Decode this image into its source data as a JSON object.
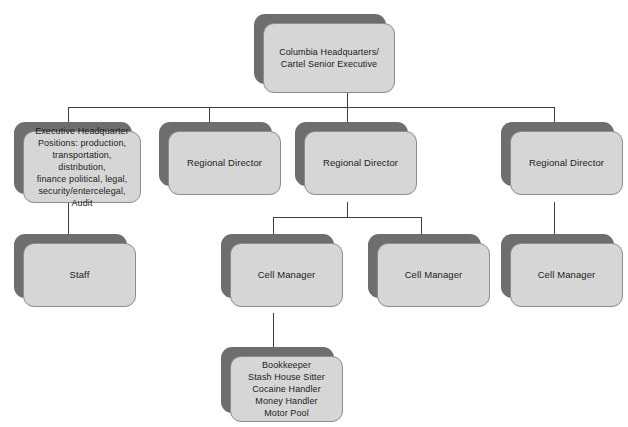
{
  "diagram": {
    "type": "org-chart",
    "colors": {
      "background": "#ffffff",
      "box_face": "#d6d6d6",
      "box_border": "#8c8c8c",
      "box_shadow": "#6e6e6e",
      "connector": "#3f3f3f",
      "text": "#1c1c1c"
    },
    "nodes": {
      "root": {
        "id": "columbia-hq",
        "label": "Columbia Headquarters/\nCartel Senior Executive"
      },
      "executive_headquarter": {
        "id": "executive-headquarter-positions",
        "label": "Executive Headquarter\nPositions: production,\ntransportation, distribution,\nfinance political, legal,\nsecurity/entercelegal, Audit"
      },
      "staff": {
        "id": "staff",
        "label": "Staff"
      },
      "regional_director_1": {
        "id": "regional-director-1",
        "label": "Regional Director"
      },
      "regional_director_2": {
        "id": "regional-director-2",
        "label": "Regional Director"
      },
      "regional_director_3": {
        "id": "regional-director-3",
        "label": "Regional Director"
      },
      "cell_manager_1": {
        "id": "cell-manager-1",
        "label": "Cell Manager"
      },
      "cell_manager_2": {
        "id": "cell-manager-2",
        "label": "Cell Manager"
      },
      "cell_manager_3": {
        "id": "cell-manager-3",
        "label": "Cell Manager"
      },
      "cell_roles": {
        "id": "cell-roles",
        "label": "Bookkeeper\nStash House Sitter\nCocaine Handler\nMoney Handler\nMotor Pool"
      }
    }
  }
}
